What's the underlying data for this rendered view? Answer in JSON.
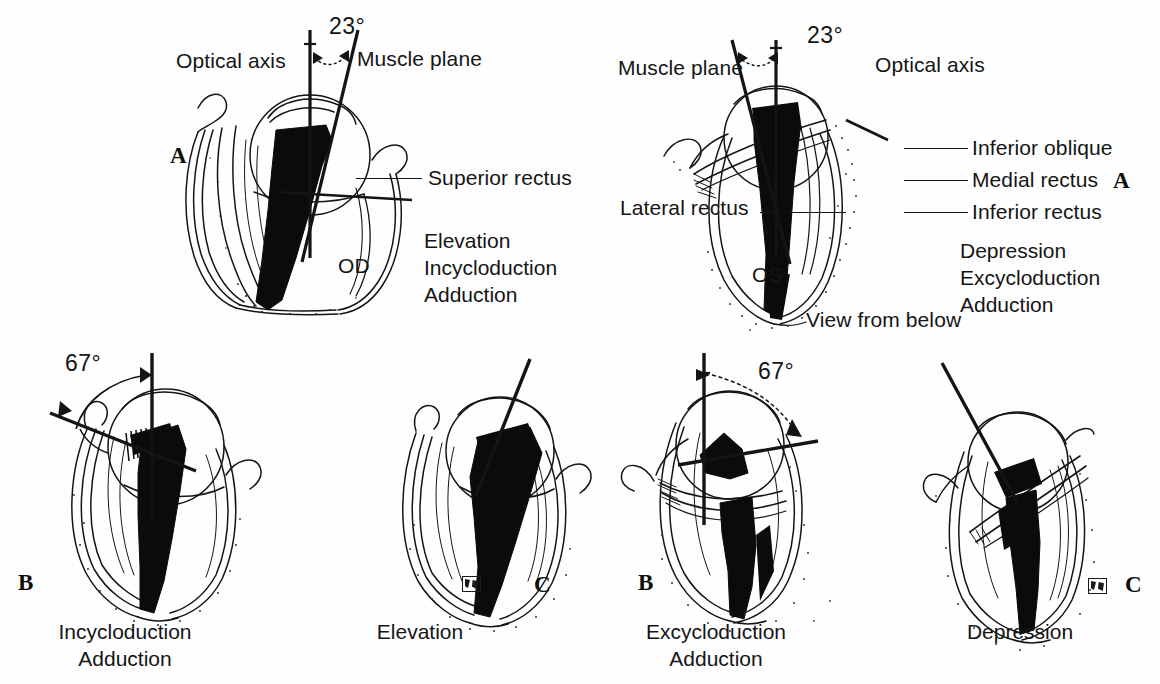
{
  "figure": {
    "ink_color": "#141414",
    "paper_color": "#fefefe"
  },
  "top_left_panel": {
    "letter": "A",
    "eye_label": "OD",
    "optical_axis_label": "Optical axis",
    "muscle_plane_label": "Muscle plane",
    "angle": "23°",
    "muscle_label": "Superior rectus",
    "actions": [
      "Elevation",
      "Incycloduction",
      "Adduction"
    ]
  },
  "top_right_panel": {
    "letter": "A",
    "eye_label": "OS",
    "optical_axis_label": "Optical axis",
    "muscle_plane_label": "Muscle plane",
    "angle": "23°",
    "view_note": "View from below",
    "callouts": [
      "Inferior oblique",
      "Medial rectus",
      "Inferior rectus",
      "Lateral rectus"
    ],
    "actions": [
      "Depression",
      "Excycloduction",
      "Adduction"
    ]
  },
  "bottom_panels": [
    {
      "letter": "B",
      "angle": "67°",
      "caption": [
        "Incycloduction",
        "Adduction"
      ]
    },
    {
      "letter": "C",
      "angle": "",
      "caption": [
        "Elevation"
      ]
    },
    {
      "letter": "B",
      "angle": "67°",
      "caption": [
        "Excycloduction",
        "Adduction"
      ]
    },
    {
      "letter": "C",
      "angle": "",
      "caption": [
        "Depression"
      ]
    }
  ]
}
